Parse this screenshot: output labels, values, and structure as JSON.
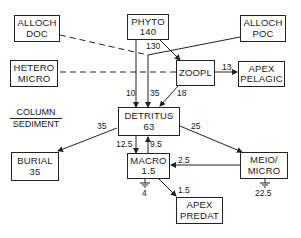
{
  "diagram": {
    "type": "food-web flow diagram",
    "nodes": {
      "alloch_doc": {
        "line1": "ALLOCH",
        "line2": "DOC"
      },
      "phyto": {
        "line1": "PHYTO",
        "line2": "140"
      },
      "alloch_poc": {
        "line1": "ALLOCH",
        "line2": "POC"
      },
      "hetero_micro": {
        "line1": "HETERO",
        "line2": "MICRO"
      },
      "zoopl": {
        "line1": "ZOOPL"
      },
      "apex_pelagic": {
        "line1": "APEX",
        "line2": "PELAGIC"
      },
      "detritus": {
        "line1": "DETRITUS",
        "line2": "63"
      },
      "burial": {
        "line1": "BURIAL",
        "line2": "35"
      },
      "macro": {
        "line1": "MACRO",
        "line2": "1.5"
      },
      "meio_micro": {
        "line1": "MEIO/",
        "line2": "MICRO"
      },
      "apex_predat": {
        "line1": "APEX",
        "line2": "PREDAT"
      }
    },
    "section_label": {
      "top": "COLUMN",
      "bottom": "SEDIMENT"
    },
    "flows": {
      "phyto_to_zoopl": "130",
      "phyto_to_detritus": "10",
      "column_to_detritus": "35",
      "zoopl_to_detritus": "18",
      "zoopl_to_apex_pelagic": "13",
      "detritus_to_burial": "35",
      "detritus_to_meio": "25",
      "detritus_to_macro": "12.5",
      "macro_to_detritus": "9.5",
      "meio_to_macro": "2.5",
      "macro_to_apex_predat": "1.5",
      "macro_respiration": "4",
      "meio_respiration": "22.5"
    }
  }
}
